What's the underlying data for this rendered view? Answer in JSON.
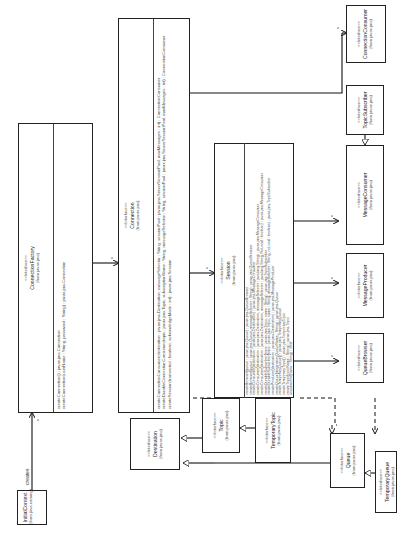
{
  "diagram": {
    "type": "uml-class-diagram",
    "orientation": "rotated-90-ccw",
    "classes": {
      "initial_context": {
        "stereotype": "",
        "name": "InitialContext",
        "package": "(from java.naming)"
      },
      "connection_factory": {
        "stereotype": "<<Interface>>",
        "name": "ConnectionFactory",
        "package": "(from javax.jms)",
        "operations": [
          "createConnection() : javax.jms.Connection",
          "createConnection(userName : String, password : String) : javax.jms.Connection"
        ]
      },
      "connection": {
        "stereotype": "<<Interface>>",
        "name": "Connection",
        "package": "(from javax.jms)",
        "operations": [
          "createConnectionConsumer(destination : javax.jms.Destination, messageSelector : String, sessionPool : javax.jms.ServerSessionPool, maxMessages : int) : ConnectionConsumer",
          "createDurableConnectionConsumer(topic : javax.jms.Topic, subscriptionName : String, messageSelector : String, sessionPool : javax.jms.ServerSessionPool, maxMessages : int) : ConnectionConsumer",
          "createSession(transacted : boolean, acknowledgeMode : int) : javax.jms.Session"
        ]
      },
      "session": {
        "stereotype": "<<Interface>>",
        "name": "Session",
        "package": "(from javax.jms)",
        "operations": [
          "createBrowser(queue : javax.jms.Queue) : javax.jms.QueueBrowser",
          "createBrowser(queue : javax.jms.Queue, messageSelector : String) : javax.jms.QueueBrowser",
          "createConsumer(destination : javax.jms.Destination) : javax.jms.MessageConsumer",
          "createConsumer(destination : javax.jms.Destination, messageSelector : java.lang.String) : javax.jms.MessageConsumer",
          "createConsumer(destination : javax.jms.Destination, messageSelector : java.lang.String, NoLocal : boolean) : javax.jms.MessageConsumer",
          "createDurableSubscriber(topic : javax.jms.Topic, name : String) : javax.jms.TopicSubscriber",
          "createDurableSubscriber(topic : javax.jms.Topic, name : String, messageSelector : String, noLocal : boolean) : javax.jms.TopicSubscriber",
          "createProducer(destination : javax.jms.Destination) : javax.jms.MessageProducer",
          "createQueue(destinationQueueName : String) : javax.jms.Queue",
          "createTemporaryQueue() : javax.jms.TemporaryQueue",
          "createTemporaryTopic() : javax.jms.TemporaryTopic",
          "createTopic(topicName : String) : javax.jms.Topic",
          "unsubscribe(name : String) : void"
        ]
      },
      "connection_consumer": {
        "stereotype": "<<Interface>>",
        "name": "ConnectionConsumer",
        "package": "(from javax.jms)"
      },
      "topic_subscriber": {
        "stereotype": "<<Interface>>",
        "name": "TopicSubscriber",
        "package": "(from javax.jms)"
      },
      "message_consumer": {
        "stereotype": "<<Interface>>",
        "name": "MessageConsumer",
        "package": "(from javax.jms)"
      },
      "message_producer": {
        "stereotype": "<<Interface>>",
        "name": "MessageProducer",
        "package": "(from javax.jms)"
      },
      "queue_browser": {
        "stereotype": "<<Interface>>",
        "name": "QueueBrowser",
        "package": "(from javax.jms)"
      },
      "destination": {
        "stereotype": "<<Interface>>",
        "name": "Destination",
        "package": "(from javax.jms)"
      },
      "topic": {
        "stereotype": "<<Interface>>",
        "name": "Topic",
        "package": "(from javax.jms)"
      },
      "temporary_topic": {
        "stereotype": "<<Interface>>",
        "name": "TemporaryTopic",
        "package": "(from javax.jms)"
      },
      "queue": {
        "stereotype": "<<Interface>>",
        "name": "Queue",
        "package": "(from javax.jms)"
      },
      "temporary_queue": {
        "stereotype": "<<Interface>>",
        "name": "TemporaryQueue",
        "package": "(from javax.jms)"
      }
    },
    "labels": {
      "creates": "creates",
      "many": "*"
    }
  }
}
